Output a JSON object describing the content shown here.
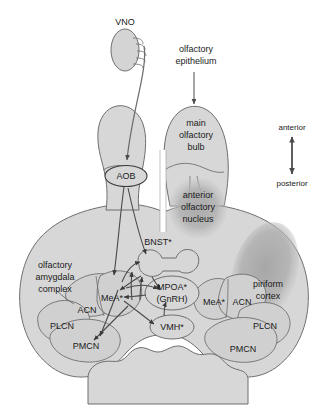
{
  "figure": {
    "type": "neuroanatomical-schematic",
    "background_color": "#ffffff",
    "brain_fill": "#d7d7d7",
    "brain_stroke": "#6f6f6f",
    "shade_dark": "#b4b4b4",
    "shade_darker": "#a8a8a8",
    "arrow_color": "#4a4a4a",
    "text_color": "#1a1a1a"
  },
  "labels": {
    "vno": "VNO",
    "olfactory_epithelium_line1": "olfactory",
    "olfactory_epithelium_line2": "epithelium",
    "main_olfactory_bulb_line1": "main",
    "main_olfactory_bulb_line2": "olfactory",
    "main_olfactory_bulb_line3": "bulb",
    "aob": "AOB",
    "anterior_olfactory_nucleus_line1": "anterior",
    "anterior_olfactory_nucleus_line2": "olfactory",
    "anterior_olfactory_nucleus_line3": "nucleus",
    "piriform_cortex_line1": "piriform",
    "piriform_cortex_line2": "cortex",
    "olfactory_amygdala_line1": "olfactory",
    "olfactory_amygdala_line2": "amygdala",
    "olfactory_amygdala_line3": "complex",
    "bnst": "BNST*",
    "mpoa": "MPOA*",
    "gnrh": "(GnRH)",
    "vmh": "VMH*",
    "mea_left": "MeA*",
    "acn_left": "ACN",
    "plcn_left": "PLCN",
    "pmcn_left": "PMCN",
    "mea_right": "MeA*",
    "acn_right": "ACN",
    "plcn_right": "PLCN",
    "pmcn_right": "PMCN"
  },
  "axis_legend": {
    "anterior": "anterior",
    "posterior": "posterior"
  }
}
